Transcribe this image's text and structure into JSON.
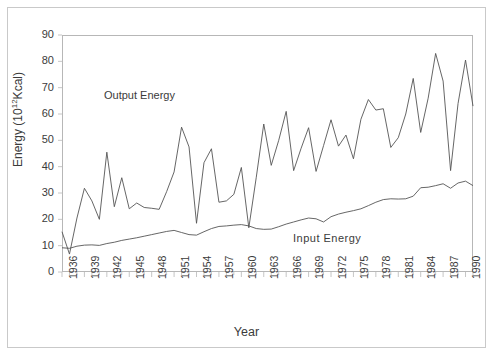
{
  "figure": {
    "xaxis_title": "Year",
    "yaxis_title_main": "Energy  (10",
    "yaxis_title_exp": "12",
    "yaxis_title_tail": "Kcal)"
  },
  "annotations": {
    "output_label": "Output Energy",
    "input_label": "Input Energy"
  },
  "colors": {
    "line": "#555555",
    "axis": "#b7b7b7",
    "frame": "#c9c9c9",
    "text": "#3b3b3b",
    "background": "#ffffff"
  },
  "chart_data": {
    "type": "line",
    "title": "",
    "xlabel": "Year",
    "ylabel": "Energy (10^12 Kcal)",
    "xlim": [
      1936,
      1991
    ],
    "ylim": [
      0,
      90
    ],
    "ytick_step": 10,
    "yticks": [
      0,
      10,
      20,
      30,
      40,
      50,
      60,
      70,
      80,
      90
    ],
    "xtick_step": 3,
    "xticks": [
      1936,
      1939,
      1942,
      1945,
      1948,
      1951,
      1954,
      1957,
      1960,
      1963,
      1966,
      1969,
      1972,
      1975,
      1978,
      1981,
      1984,
      1987,
      1990
    ],
    "x": [
      1936,
      1937,
      1938,
      1939,
      1940,
      1941,
      1942,
      1943,
      1944,
      1945,
      1946,
      1947,
      1948,
      1949,
      1950,
      1951,
      1952,
      1953,
      1954,
      1955,
      1956,
      1957,
      1958,
      1959,
      1960,
      1961,
      1962,
      1963,
      1964,
      1965,
      1966,
      1967,
      1968,
      1969,
      1970,
      1971,
      1972,
      1973,
      1974,
      1975,
      1976,
      1977,
      1978,
      1979,
      1980,
      1981,
      1982,
      1983,
      1984,
      1985,
      1986,
      1987,
      1988,
      1989,
      1990,
      1991
    ],
    "grid": false,
    "legend_position": "inline-annotations",
    "series": [
      {
        "name": "Output Energy",
        "values": [
          15.3,
          6.8,
          20.5,
          31.8,
          27.0,
          20.0,
          45.5,
          24.8,
          35.8,
          24.0,
          26.2,
          24.5,
          24.2,
          23.8,
          30.5,
          38.0,
          55.0,
          47.5,
          18.5,
          41.5,
          46.8,
          26.5,
          27.0,
          29.5,
          39.7,
          16.8,
          36.0,
          56.2,
          40.5,
          50.0,
          61.0,
          38.5,
          47.0,
          54.8,
          38.2,
          48.0,
          57.8,
          47.8,
          52.0,
          43.0,
          58.0,
          65.5,
          61.5,
          62.0,
          47.3,
          51.0,
          60.0,
          73.5,
          53.0,
          66.0,
          83.0,
          72.5,
          38.5,
          64.0,
          80.5,
          63.0
        ]
      },
      {
        "name": "Input Energy",
        "values": [
          9.2,
          9.0,
          9.8,
          10.2,
          10.3,
          10.1,
          10.8,
          11.3,
          12.0,
          12.5,
          13.0,
          13.6,
          14.2,
          14.8,
          15.4,
          15.8,
          15.0,
          14.2,
          14.0,
          15.3,
          16.5,
          17.3,
          17.5,
          17.8,
          18.0,
          17.5,
          16.5,
          16.2,
          16.3,
          17.2,
          18.2,
          19.0,
          19.8,
          20.5,
          20.2,
          19.0,
          21.0,
          22.0,
          22.7,
          23.3,
          24.0,
          25.2,
          26.5,
          27.5,
          27.8,
          27.7,
          27.8,
          28.8,
          32.0,
          32.2,
          32.8,
          33.5,
          31.8,
          33.8,
          34.5,
          32.8
        ]
      }
    ]
  }
}
